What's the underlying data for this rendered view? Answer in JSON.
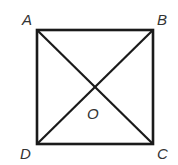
{
  "diagram": {
    "type": "geometry-figure",
    "shape": "square",
    "points": {
      "A": {
        "label": "A",
        "x": 37,
        "y": 30,
        "label_x": 22,
        "label_y": 25
      },
      "B": {
        "label": "B",
        "x": 153,
        "y": 30,
        "label_x": 157,
        "label_y": 25
      },
      "C": {
        "label": "C",
        "x": 153,
        "y": 144,
        "label_x": 157,
        "label_y": 159
      },
      "D": {
        "label": "D",
        "x": 37,
        "y": 144,
        "label_x": 20,
        "label_y": 159
      },
      "O": {
        "label": "O",
        "x": 95,
        "y": 87,
        "label_x": 87,
        "label_y": 119
      }
    },
    "segments": [
      "AB",
      "BC",
      "CD",
      "DA",
      "AC",
      "BD"
    ],
    "stroke_color": "#1a1a1a",
    "label_color": "#333333"
  }
}
